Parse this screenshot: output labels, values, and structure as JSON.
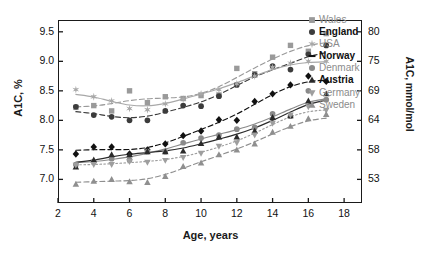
{
  "chart_data": {
    "type": "scatter",
    "title": "",
    "xlabel": "Age, years",
    "ylabel": "A1C, %",
    "ylabel_right": "A1C, mmol/mol",
    "xlim": [
      2,
      19
    ],
    "ylim": [
      6.6,
      9.7
    ],
    "xticks": [
      2,
      4,
      6,
      8,
      10,
      12,
      14,
      16,
      18
    ],
    "yticks_left": [
      "7.0",
      "7.5",
      "8.0",
      "8.5",
      "9.0",
      "9.5"
    ],
    "yticks_left_values": [
      7.0,
      7.5,
      8.0,
      8.5,
      9.0,
      9.5
    ],
    "yticks_right": [
      "53",
      "58",
      "64",
      "69",
      "75",
      "80"
    ],
    "yticks_right_values": [
      7.0,
      7.5,
      8.0,
      8.5,
      9.0,
      9.5
    ],
    "grid": false,
    "legend_position": "right",
    "x": [
      3,
      4,
      5,
      6,
      7,
      8,
      9,
      10,
      11,
      12,
      13,
      14,
      15,
      16,
      17
    ],
    "series": [
      {
        "name": "Wales",
        "marker": "square",
        "color": "#9a9a9a",
        "line": "dashed",
        "values": [
          8.22,
          8.25,
          8.16,
          8.5,
          8.3,
          8.4,
          8.37,
          8.42,
          8.43,
          8.88,
          8.79,
          9.07,
          9.27,
          9.17,
          9.47
        ]
      },
      {
        "name": "England",
        "marker": "circle",
        "color": "#3c3c3c",
        "line": "dashed",
        "values": [
          8.23,
          8.09,
          8.06,
          8.0,
          8.0,
          8.16,
          8.25,
          8.24,
          8.41,
          8.6,
          8.77,
          8.92,
          8.86,
          9.12,
          9.27
        ]
      },
      {
        "name": "USA",
        "marker": "star",
        "color": "#a8a8a8",
        "line": "solid",
        "values": [
          8.52,
          8.4,
          8.33,
          8.2,
          8.18,
          8.28,
          8.36,
          8.45,
          8.52,
          8.62,
          8.75,
          8.9,
          8.97,
          9.0,
          9.0
        ]
      },
      {
        "name": "Norway",
        "marker": "diamond",
        "color": "#111111",
        "line": "dashed",
        "values": [
          7.43,
          7.55,
          7.55,
          7.43,
          7.5,
          7.6,
          7.74,
          7.82,
          8.01,
          8.0,
          8.32,
          8.45,
          8.6,
          8.75,
          8.66
        ]
      },
      {
        "name": "Denmark",
        "marker": "circle",
        "color": "#8a8a8a",
        "line": "solid",
        "values": [
          7.25,
          7.3,
          7.35,
          7.33,
          7.47,
          7.47,
          7.62,
          7.7,
          7.75,
          7.85,
          7.88,
          8.11,
          8.07,
          8.5,
          8.35
        ]
      },
      {
        "name": "Austria",
        "marker": "triangle",
        "color": "#2a2a2a",
        "line": "solid",
        "values": [
          7.21,
          7.33,
          7.42,
          7.42,
          7.47,
          7.47,
          7.48,
          7.61,
          7.72,
          7.72,
          7.82,
          8.05,
          8.08,
          8.33,
          8.45
        ]
      },
      {
        "name": "Germany",
        "marker": "triangle-down",
        "color": "#9e9e9e",
        "line": "dotted",
        "values": [
          7.24,
          7.25,
          7.25,
          7.3,
          7.29,
          7.32,
          7.37,
          7.44,
          7.56,
          7.62,
          7.75,
          7.95,
          8.09,
          8.23,
          8.17
        ]
      },
      {
        "name": "Sweden",
        "marker": "triangle",
        "color": "#8f8f8f",
        "line": "dashed",
        "values": [
          6.92,
          6.97,
          7.0,
          6.96,
          6.95,
          7.05,
          7.22,
          7.28,
          7.42,
          7.5,
          7.6,
          7.8,
          7.9,
          8.03,
          8.1
        ]
      }
    ]
  },
  "legend": {
    "items": [
      {
        "label": "Wales",
        "marker": "square-icon",
        "bold": false
      },
      {
        "label": "England",
        "marker": "circle-icon",
        "bold": true
      },
      {
        "label": "USA",
        "marker": "star-icon",
        "bold": false
      },
      {
        "label": "Norway",
        "marker": "dash-icon",
        "bold": true
      },
      {
        "label": "Denmark",
        "marker": "circle-icon",
        "bold": false
      },
      {
        "label": "Austria",
        "marker": "triangle-icon",
        "bold": true
      },
      {
        "label": "Germany",
        "marker": "triangle-down-icon",
        "bold": false
      },
      {
        "label": "Sweden",
        "marker": "triangle-icon",
        "bold": false
      }
    ]
  }
}
